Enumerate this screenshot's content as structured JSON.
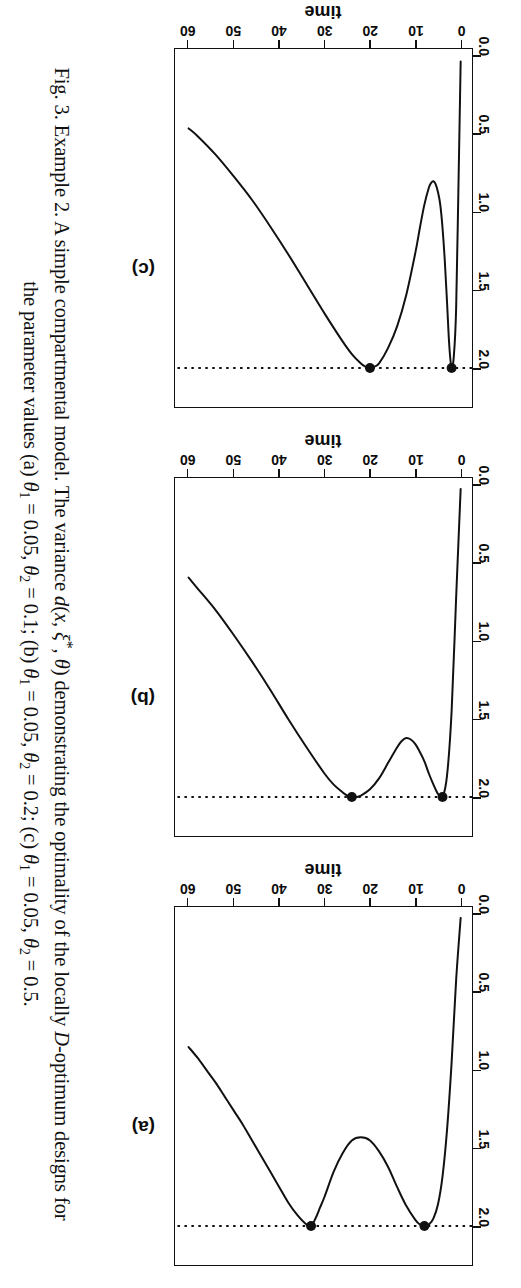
{
  "figure": {
    "caption_label": "Fig. 3.",
    "caption_line1_a": "Example 2. A simple compartmental model. The variance ",
    "caption_line1_d": "d",
    "caption_line1_args_open": "(",
    "caption_line1_x": "x",
    "caption_line1_comma1": ", ",
    "caption_line1_xi": "ξ",
    "caption_line1_star": "*",
    "caption_line1_comma2": ", ",
    "caption_line1_theta": "θ",
    "caption_line1_args_close": ")",
    "caption_line1_b": " demonstrating the optimality of the locally ",
    "caption_line1_D": "D",
    "caption_line1_c": "-optimum designs for",
    "caption_line2_a": "the parameter values (a) ",
    "caption_line2_b": " = 0.05, ",
    "caption_line2_c": " = 0.1; (b) ",
    "caption_line2_d": " = 0.05, ",
    "caption_line2_e": " = 0.2; (c) ",
    "caption_line2_f": " = 0.05, ",
    "caption_line2_g": " = 0.5.",
    "theta_sym": "θ",
    "sub_1": "1",
    "sub_2": "2"
  },
  "axes": {
    "x_title": "time",
    "y_title": "variance",
    "x_ticks": [
      "0",
      "10",
      "20",
      "30",
      "40",
      "50",
      "60"
    ],
    "y_ticks": [
      "0.0",
      "0.5",
      "1.0",
      "1.5",
      "2.0"
    ]
  },
  "panels": [
    {
      "letter": "(a)",
      "name": "panel-a"
    },
    {
      "letter": "(b)",
      "name": "panel-b"
    },
    {
      "letter": "(c)",
      "name": "panel-c"
    }
  ],
  "chart_data": [
    {
      "type": "line",
      "panel": "(a)",
      "title": "(a)",
      "xlabel": "time",
      "ylabel": "variance",
      "xlim": [
        -2.5,
        63
      ],
      "ylim": [
        -0.05,
        2.25
      ],
      "xticks": [
        0,
        10,
        20,
        30,
        40,
        50,
        60
      ],
      "yticks": [
        0.0,
        0.5,
        1.0,
        1.5,
        2.0
      ],
      "grid": false,
      "legend": "none",
      "params": {
        "theta1": 0.05,
        "theta2": 0.1
      },
      "reference_line": {
        "orientation": "horizontal",
        "y": 2.0,
        "style": "dotted"
      },
      "support_points": [
        {
          "x": 8.0,
          "y": 2.0
        },
        {
          "x": 33.0,
          "y": 2.0
        }
      ],
      "x": [
        0,
        1,
        2,
        3,
        4,
        5,
        6,
        7,
        8,
        9,
        10,
        12,
        14,
        16,
        18,
        20,
        22,
        24,
        26,
        28,
        30,
        31,
        32,
        33,
        34,
        36,
        38,
        40,
        42,
        44,
        46,
        48,
        50,
        52,
        54,
        56,
        58,
        60
      ],
      "values": [
        0.02,
        0.42,
        0.95,
        1.38,
        1.68,
        1.86,
        1.95,
        1.99,
        2.0,
        1.99,
        1.96,
        1.87,
        1.75,
        1.62,
        1.52,
        1.45,
        1.43,
        1.45,
        1.53,
        1.65,
        1.81,
        1.88,
        1.95,
        2.0,
        1.99,
        1.93,
        1.85,
        1.75,
        1.65,
        1.55,
        1.45,
        1.35,
        1.26,
        1.17,
        1.08,
        1.0,
        0.92,
        0.85
      ]
    },
    {
      "type": "line",
      "panel": "(b)",
      "title": "(b)",
      "xlabel": "time",
      "ylabel": "variance",
      "xlim": [
        -2.5,
        63
      ],
      "ylim": [
        -0.05,
        2.25
      ],
      "xticks": [
        0,
        10,
        20,
        30,
        40,
        50,
        60
      ],
      "yticks": [
        0.0,
        0.5,
        1.0,
        1.5,
        2.0
      ],
      "grid": false,
      "legend": "none",
      "params": {
        "theta1": 0.05,
        "theta2": 0.2
      },
      "reference_line": {
        "orientation": "horizontal",
        "y": 2.0,
        "style": "dotted"
      },
      "support_points": [
        {
          "x": 4.0,
          "y": 2.0
        },
        {
          "x": 24.0,
          "y": 2.0
        }
      ],
      "x": [
        0,
        1,
        2,
        3,
        4,
        5,
        6,
        7,
        8,
        9,
        10,
        11,
        12,
        13,
        14,
        16,
        18,
        20,
        22,
        23,
        24,
        25,
        26,
        28,
        30,
        34,
        38,
        42,
        46,
        50,
        54,
        58,
        60
      ],
      "values": [
        0.02,
        0.72,
        1.45,
        1.86,
        2.0,
        1.98,
        1.92,
        1.85,
        1.77,
        1.71,
        1.66,
        1.63,
        1.62,
        1.64,
        1.68,
        1.78,
        1.88,
        1.95,
        1.99,
        2.0,
        2.0,
        1.99,
        1.97,
        1.92,
        1.85,
        1.68,
        1.5,
        1.31,
        1.13,
        0.96,
        0.8,
        0.66,
        0.59
      ]
    },
    {
      "type": "line",
      "panel": "(c)",
      "title": "(c)",
      "xlabel": "time",
      "ylabel": "variance",
      "xlim": [
        -2.5,
        63
      ],
      "ylim": [
        -0.05,
        2.25
      ],
      "xticks": [
        0,
        10,
        20,
        30,
        40,
        50,
        60
      ],
      "yticks": [
        0.0,
        0.5,
        1.0,
        1.5,
        2.0
      ],
      "grid": false,
      "legend": "none",
      "params": {
        "theta1": 0.05,
        "theta2": 0.5
      },
      "reference_line": {
        "orientation": "horizontal",
        "y": 2.0,
        "style": "dotted"
      },
      "support_points": [
        {
          "x": 2.0,
          "y": 2.0
        },
        {
          "x": 20.0,
          "y": 2.0
        }
      ],
      "x": [
        0,
        0.5,
        1,
        1.5,
        2,
        2.5,
        3,
        3.5,
        4,
        4.5,
        5,
        5.5,
        6,
        6.5,
        7,
        8,
        9,
        10,
        12,
        14,
        16,
        18,
        19,
        20,
        21,
        22,
        24,
        26,
        30,
        34,
        38,
        42,
        46,
        50,
        54,
        58,
        60
      ],
      "values": [
        0.03,
        0.85,
        1.62,
        1.92,
        2.0,
        1.86,
        1.58,
        1.31,
        1.1,
        0.95,
        0.87,
        0.82,
        0.8,
        0.81,
        0.84,
        0.95,
        1.1,
        1.26,
        1.53,
        1.73,
        1.87,
        1.97,
        1.99,
        2.0,
        1.99,
        1.97,
        1.91,
        1.83,
        1.65,
        1.46,
        1.27,
        1.09,
        0.92,
        0.77,
        0.63,
        0.51,
        0.46
      ]
    }
  ]
}
